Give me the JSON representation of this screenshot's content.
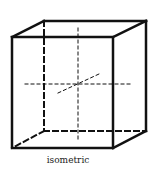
{
  "diagram": {
    "caption": "isometric",
    "line_color": "#111111",
    "shape": "cube",
    "front_face": {
      "x1": 12,
      "y1": 37,
      "x2": 113,
      "y2": 148
    },
    "back_face": {
      "x1": 44,
      "y1": 21,
      "x2": 146,
      "y2": 131
    }
  }
}
